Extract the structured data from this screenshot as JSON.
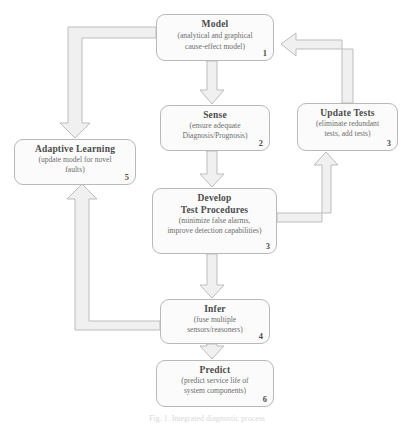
{
  "figure": {
    "caption": "Fig. 1.  Integrated diagnostic process"
  },
  "colors": {
    "node_fill": "#fbfbfb",
    "node_stroke": "#b9b9b9",
    "arrow_fill": "#f0f0f0",
    "arrow_stroke": "#bdbdbd",
    "title_text": "#4c4c4c",
    "sub_text": "#6d6d6d"
  },
  "nodes": {
    "model": {
      "title": "Model",
      "sub_line1": "(analytical and graphical",
      "sub_line2": "cause-effect model)",
      "number": "1"
    },
    "sense": {
      "title": "Sense",
      "sub_line1": "(ensure adequate",
      "sub_line2": "Diagnosis/Prognosis)",
      "number": "2"
    },
    "update_tests": {
      "title": "Update Tests",
      "sub_line1": "(eliminate redundant",
      "sub_line2": "tests, add tests)",
      "number": "3"
    },
    "adaptive_learning": {
      "title": "Adaptive  Learning",
      "sub_line1": "(update model for novel",
      "sub_line2": "faults)",
      "number": "5"
    },
    "develop_test_procedures": {
      "title_line1": "Develop",
      "title_line2": "Test Procedures",
      "sub_line1": "(minimize  false alarms,",
      "sub_line2": "improve detection capabilities)",
      "number": "3"
    },
    "infer": {
      "title": "Infer",
      "sub_line1": "(fuse multiple",
      "sub_line2": "sensors/reasoners)",
      "number": "4"
    },
    "predict": {
      "title": "Predict",
      "sub_line1": "(predict  service life of",
      "sub_line2": "system components)",
      "number": "6"
    }
  },
  "edges": [
    {
      "name": "model-to-sense",
      "from": "model",
      "to": "sense",
      "direction": "down"
    },
    {
      "name": "sense-to-develop",
      "from": "sense",
      "to": "develop_test_procedures",
      "direction": "down"
    },
    {
      "name": "develop-to-infer",
      "from": "develop_test_procedures",
      "to": "infer",
      "direction": "down"
    },
    {
      "name": "infer-to-predict",
      "from": "infer",
      "to": "predict",
      "direction": "down"
    },
    {
      "name": "model-to-adaptive-learning",
      "from": "model",
      "to": "adaptive_learning",
      "direction": "left-down"
    },
    {
      "name": "infer-to-adaptive-learning",
      "from": "infer",
      "to": "adaptive_learning",
      "direction": "left-up"
    },
    {
      "name": "develop-to-update-tests",
      "from": "develop_test_procedures",
      "to": "update_tests",
      "direction": "right-up"
    },
    {
      "name": "update-tests-to-model",
      "from": "update_tests",
      "to": "model",
      "direction": "up-left"
    }
  ]
}
